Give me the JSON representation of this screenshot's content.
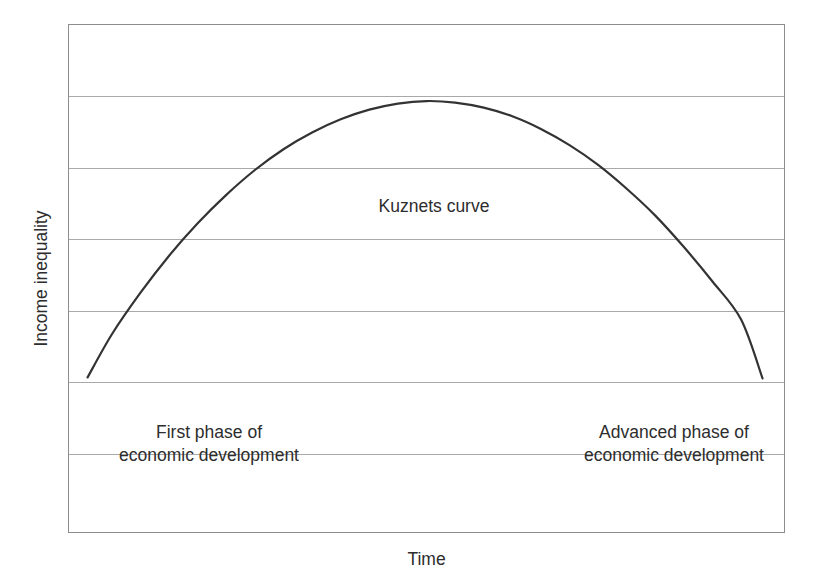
{
  "figure": {
    "width": 817,
    "height": 587,
    "background_color": "#ffffff"
  },
  "axes": {
    "y_title": "Income inequality",
    "x_title": "Time",
    "frame_color": "#8d8d8d",
    "grid_color": "#a9a9a9"
  },
  "annotations": {
    "curve_name": "Kuznets curve",
    "phase_left": "First phase of\neconomic development",
    "phase_right": "Advanced phase of\neconomic development"
  },
  "chart_data": {
    "type": "line",
    "title": "",
    "subtitle": "",
    "xlabel": "Time",
    "ylabel": "Income inequality",
    "xlim": [
      0,
      100
    ],
    "ylim": [
      0,
      100
    ],
    "grid": true,
    "grid_axis": "y",
    "grid_lines_y": [
      14.3,
      28.6,
      42.9,
      57.1,
      71.4,
      85.7
    ],
    "x_tick_labels": [],
    "y_tick_labels": [],
    "legend": false,
    "legend_position": "none",
    "line_color": "#333333",
    "line_width": 2.2,
    "series": [
      {
        "name": "Kuznets curve",
        "shape": "inverted-U parabola",
        "x": [
          2.6,
          6,
          10,
          14,
          18,
          22,
          26,
          30,
          34,
          38,
          42,
          46,
          50,
          54,
          58,
          62,
          66,
          70,
          74,
          78,
          82,
          86,
          90,
          94,
          97.0
        ],
        "y": [
          30.5,
          39.0,
          47.2,
          54.5,
          60.9,
          66.5,
          71.4,
          75.5,
          78.8,
          81.4,
          83.3,
          84.5,
          85.0,
          84.7,
          83.7,
          82.0,
          79.5,
          76.3,
          72.4,
          67.7,
          62.4,
          56.2,
          49.4,
          41.9,
          30.3
        ]
      }
    ],
    "annotations": [
      {
        "text": "Kuznets curve",
        "x": 50,
        "y": 64,
        "halign": "center"
      },
      {
        "text": "First phase of economic development",
        "x": 18,
        "y": 20,
        "halign": "center"
      },
      {
        "text": "Advanced phase of economic development",
        "x": 83,
        "y": 20,
        "halign": "center"
      }
    ]
  }
}
